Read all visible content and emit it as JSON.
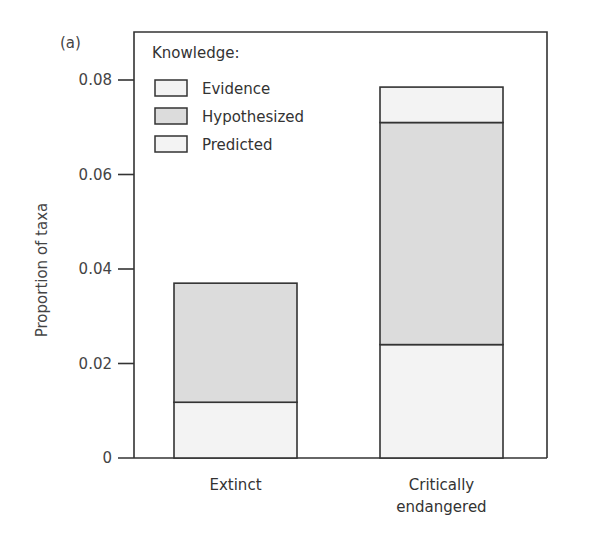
{
  "panel_label": "(a)",
  "chart_data": {
    "type": "bar",
    "stacked": true,
    "title": "",
    "xlabel": "",
    "ylabel": "Proportion of taxa",
    "ylim": [
      0,
      0.08
    ],
    "yticks": [
      "0",
      "0.02",
      "0.04",
      "0.06",
      "0.08"
    ],
    "categories": [
      "Extinct",
      "Critically endangered"
    ],
    "category_lines": [
      [
        "Extinct"
      ],
      [
        "Critically",
        "endangered"
      ]
    ],
    "series": [
      {
        "name": "Predicted",
        "values": [
          0.0118,
          0.024
        ],
        "color": "#f3f3f3"
      },
      {
        "name": "Hypothesized",
        "values": [
          0.0252,
          0.047
        ],
        "color": "#dcdcdc"
      },
      {
        "name": "Evidence",
        "values": [
          0.0,
          0.0075
        ],
        "color": "#f3f3f3"
      }
    ],
    "legend": {
      "title": "Knowledge:",
      "position": "top-left inside",
      "entries": [
        {
          "label": "Evidence",
          "color": "#f3f3f3"
        },
        {
          "label": "Hypothesized",
          "color": "#dcdcdc"
        },
        {
          "label": "Predicted",
          "color": "#f3f3f3"
        }
      ]
    },
    "grid": false
  }
}
